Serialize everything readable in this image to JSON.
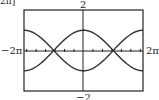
{
  "chart_data": {
    "type": "line",
    "title": "",
    "xlabel": "",
    "ylabel": "",
    "xlim": [
      "-2π",
      "2π"
    ],
    "ylim": [
      -2,
      2
    ],
    "xlim_numeric": [
      -6.2832,
      6.2832
    ],
    "tick_labels": {
      "y_max": "2",
      "y_min": "−2",
      "x_min": "−2π",
      "x_max": "2π"
    },
    "corner_fragment": "2π]",
    "grid": false,
    "legend": null,
    "series": [
      {
        "name": "upper curve (y = cos(x/2))",
        "x": [
          -6.2832,
          -4.7124,
          -3.1416,
          -1.5708,
          0,
          1.5708,
          3.1416,
          4.7124,
          6.2832
        ],
        "values": [
          -1,
          -0.707,
          0,
          0.707,
          1,
          0.707,
          0,
          -0.707,
          -1
        ]
      },
      {
        "name": "lower curve (y = −cos(x/2))",
        "x": [
          -6.2832,
          -4.7124,
          -3.1416,
          -1.5708,
          0,
          1.5708,
          3.1416,
          4.7124,
          6.2832
        ],
        "values": [
          1,
          0.707,
          0,
          -0.707,
          -1,
          -0.707,
          0,
          0.707,
          1
        ]
      }
    ],
    "intersections": [
      [
        "-π",
        0
      ],
      [
        "π",
        0
      ]
    ]
  },
  "labels": {
    "top": "2",
    "bottom": "−2",
    "left": "−2π",
    "right": "2π",
    "corner": "2π]"
  },
  "colors": {
    "curve": "#333333",
    "frame": "#222222",
    "background": "#ffffff"
  }
}
